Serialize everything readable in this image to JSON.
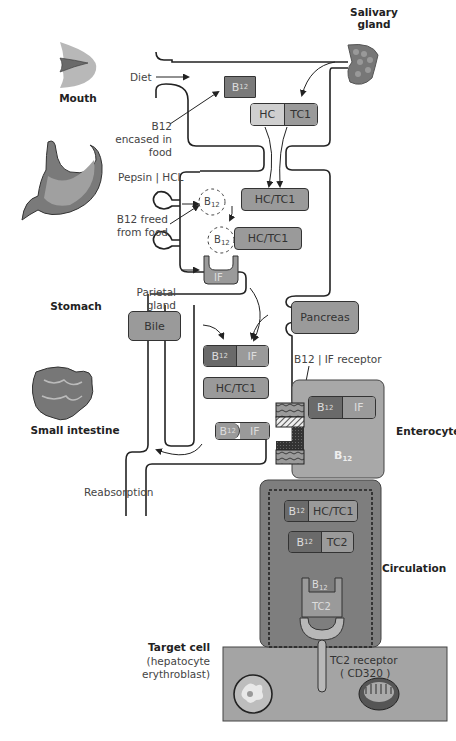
{
  "organs": {
    "mouth": "Mouth",
    "salivary_gland": "Salivary gland",
    "stomach": "Stomach",
    "small_intestine": "Small intestine",
    "enterocyte": "Enterocyte",
    "circulation": "Circulation",
    "target_cell": "Target cell",
    "target_cell_examples": "(hepatocyte erythroblast)"
  },
  "labels": {
    "diet": "Diet",
    "b12_encased": "B12 encased in food",
    "pepsin_hcl": "Pepsin | HCL",
    "b12_freed": "B12 freed from food",
    "parietal_gland": "Parietal gland",
    "b12_if_receptor": "B12 | IF receptor",
    "reabsorption": "Reabsorption",
    "tc2_receptor": "TC2 receptor",
    "cd320": "( CD320 )"
  },
  "boxes": {
    "b12": "B",
    "b12_sub": "12",
    "hc": "HC",
    "tc1": "TC1",
    "hc_tc1": "HC/TC1",
    "if": "IF",
    "bile": "Bile",
    "pancreas": "Pancreas",
    "tc2": "TC2"
  },
  "colors": {
    "dark": "#6a6a6a",
    "mid": "#9a9a9a",
    "light": "#cfcfcf",
    "enterocyte": "#a8a8a8",
    "circulation": "#7e7e7e",
    "target_cell": "#a4a4a4"
  }
}
